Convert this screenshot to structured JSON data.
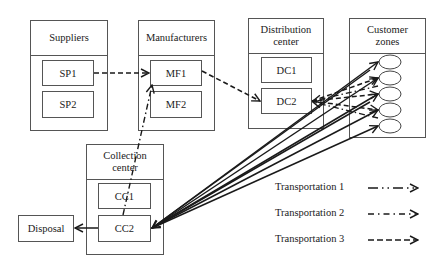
{
  "groups": {
    "suppliers": {
      "title": "Suppliers",
      "nodes": [
        "SP1",
        "SP2"
      ]
    },
    "manufacturers": {
      "title": "Manufacturers",
      "nodes": [
        "MF1",
        "MF2"
      ]
    },
    "distribution": {
      "title": "Distribution center",
      "nodes": [
        "DC1",
        "DC2"
      ]
    },
    "customers": {
      "title": "Customer zones",
      "zone_count": 5
    },
    "collection": {
      "title": "Collection center",
      "nodes": [
        "CC1",
        "CC2"
      ]
    }
  },
  "disposal": {
    "label": "Disposal"
  },
  "legend": {
    "items": [
      {
        "label": "Transportation 1",
        "style": "dash-dot-dot"
      },
      {
        "label": "Transportation 2",
        "style": "dash-dot"
      },
      {
        "label": "Transportation 3",
        "style": "dashed"
      }
    ]
  },
  "flows": [
    {
      "from": "SP1",
      "to": "MF1",
      "transport": "Transportation 3"
    },
    {
      "from": "MF1",
      "to": "DC2",
      "transport": "Transportation 3"
    },
    {
      "from": "DC2",
      "to": "Customer zones",
      "transport": "Transportation 3"
    },
    {
      "from": "Customer zones",
      "to": "CC2",
      "transport": "solid"
    },
    {
      "from": "CC1",
      "to": "MF1",
      "transport": "Transportation 2"
    },
    {
      "from": "CC2",
      "to": "Disposal",
      "transport": "solid"
    }
  ],
  "colors": {
    "line": "#1a1a1a",
    "border": "#555555",
    "background": "#ffffff"
  }
}
